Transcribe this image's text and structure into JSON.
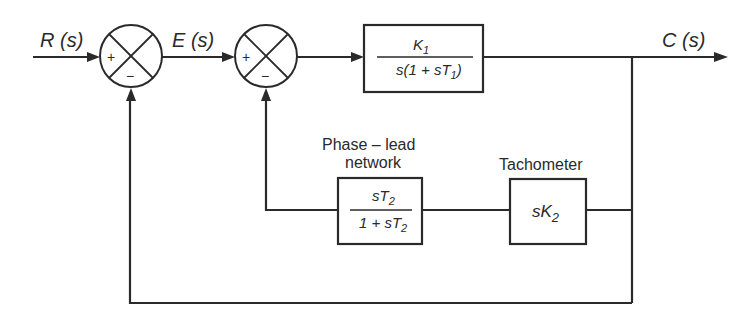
{
  "diagram": {
    "signals": {
      "input": "R (s)",
      "error": "E (s)",
      "output": "C (s)"
    },
    "summing_junctions": [
      {
        "id": "sum1",
        "plus_sign": "+",
        "minus_sign": "−"
      },
      {
        "id": "sum2",
        "plus_sign": "+",
        "minus_sign": "−"
      }
    ],
    "blocks": {
      "forward": {
        "numerator": {
          "main": "K",
          "sub": "1"
        },
        "denominator": {
          "pre": "s(1 + sT",
          "sub": "1",
          "post": ")"
        }
      },
      "phase_lead": {
        "caption_line1": "Phase – lead",
        "caption_line2": "network",
        "numerator": {
          "pre": "sT",
          "sub": "2"
        },
        "denominator": {
          "pre": "1 + sT",
          "sub": "2"
        }
      },
      "tachometer": {
        "caption": "Tachometer",
        "expr": {
          "pre": "sK",
          "sub": "2"
        }
      }
    }
  }
}
